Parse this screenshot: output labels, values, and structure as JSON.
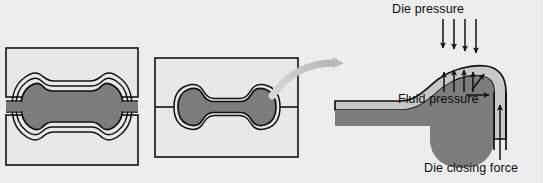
{
  "figure": {
    "background_color": "#eeeeee"
  },
  "colors": {
    "background": "#eeeeee",
    "workpiece_fill": "#7d7d7d",
    "die_fill": "#e9e9e9",
    "sheet_fill": "#c9c9c9",
    "outline": "#111111",
    "callout_arrow": "#bdbdbd",
    "label_text": "#0d0d0d"
  },
  "panels": [
    {
      "id": "panel-open-die",
      "name": "open-die-stage",
      "description": "Tube partially expanded between open upper and lower die halves, showing three progressive deformation contours"
    },
    {
      "id": "panel-closed-die",
      "name": "closed-die-stage",
      "description": "Closed die containing the fully formed dumbbell shaped part"
    },
    {
      "id": "panel-detail",
      "name": "detail-corner-view",
      "description": "Magnified corner detail showing die pressure, fluid pressure and die closing force"
    }
  ],
  "labels": {
    "die_pressure": "Die pressure",
    "fluid_pressure": "Fluid pressure",
    "die_closing_force": "Die closing force"
  },
  "arrows": {
    "die_pressure": {
      "direction": "down",
      "count": 4,
      "icon": "arrow-down-icon"
    },
    "fluid_pressure": {
      "direction": "up",
      "count": 4,
      "icon": "arrow-up-icon"
    },
    "fluid_pressure_diagonal": {
      "direction": "up-right",
      "count": 1,
      "icon": "arrow-diagonal-icon"
    },
    "fluid_pressure_horizontal": {
      "direction": "right",
      "count": 1,
      "icon": "arrow-right-icon"
    },
    "die_closing_force": {
      "direction": "up",
      "count": 1,
      "icon": "arrow-up-icon"
    },
    "callout": {
      "direction": "right-curved",
      "count": 1,
      "icon": "curved-callout-arrow-icon"
    }
  }
}
